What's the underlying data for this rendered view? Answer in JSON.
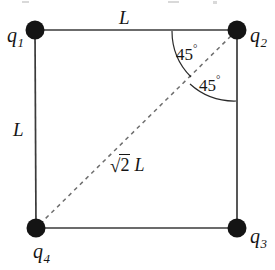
{
  "figure": {
    "type": "geometry-diagram",
    "background_color": "#ffffff",
    "stroke_color": "#3a3a3a",
    "dot_color": "#1a1a1a",
    "charges": [
      {
        "id": "q1",
        "base": "q",
        "subscript": "1",
        "x": 35,
        "y": 30,
        "label_position": "left"
      },
      {
        "id": "q2",
        "base": "q",
        "subscript": "2",
        "x": 237,
        "y": 30,
        "label_position": "right"
      },
      {
        "id": "q3",
        "base": "q",
        "subscript": "3",
        "x": 237,
        "y": 228,
        "label_position": "right"
      },
      {
        "id": "q4",
        "base": "q",
        "subscript": "4",
        "x": 36,
        "y": 228,
        "label_position": "below"
      }
    ],
    "side_labels": [
      {
        "id": "top-side",
        "text": "L",
        "edge": "top"
      },
      {
        "id": "left-side",
        "text": "L",
        "edge": "left"
      }
    ],
    "diagonal": {
      "id": "diagonal-q4-q2",
      "style": "dashed",
      "from": "q4",
      "to": "q2",
      "radical_symbol": "√",
      "radicand": "2",
      "length_text": "L",
      "full_text": "√2 L"
    },
    "angles": [
      {
        "id": "angle-upper",
        "value": "45",
        "degree_symbol": "°",
        "text": "45°",
        "vertex": "q2",
        "between": "top-edge and diagonal"
      },
      {
        "id": "angle-lower",
        "value": "45",
        "degree_symbol": "°",
        "text": "45°",
        "vertex": "q2",
        "between": "diagonal and right-edge"
      }
    ]
  }
}
